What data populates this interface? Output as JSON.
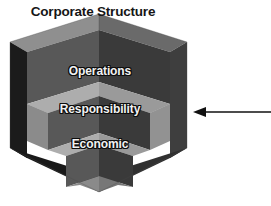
{
  "figure": {
    "title": "Corporate Structure",
    "footer_fragment": "",
    "tiers": [
      {
        "id": "operations",
        "label": "Operations"
      },
      {
        "id": "responsibility",
        "label": "Responsibility"
      },
      {
        "id": "economic",
        "label": "Economic"
      }
    ],
    "annotation": {
      "arrow_icon": "left-arrow-icon",
      "direction": "left"
    },
    "colors": {
      "background": "#ffffff",
      "title_text": "#161616",
      "label_text": "#f2f2f2",
      "label_outline": "#0d0d0d",
      "face_left_dark": "#1b1b1b",
      "face_top_mid": "#585858",
      "face_right_mid": "#3a3a3a",
      "face_step_light": "#adadad",
      "face_step_shadow": "#6e6e6e",
      "face_inner_dark": "#2c2c2c",
      "arrow": "#111111"
    }
  }
}
